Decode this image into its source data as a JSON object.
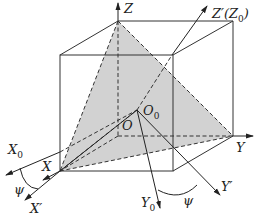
{
  "figure": {
    "colors": {
      "line": "#333333",
      "fill": "#d2d2d2"
    },
    "labels": {
      "z": "Z",
      "z_prime": "Z′(Z",
      "z_prime_sub": "0",
      "z_prime_close": ")",
      "x0": "X",
      "x0_sub": "0",
      "x": "X",
      "x_prime": "X′",
      "psi_left": "ψ",
      "o": "O",
      "o0": "O",
      "o0_sub": "0",
      "y": "Y",
      "y_prime": "Y′",
      "y0": "Y",
      "y0_sub": "0",
      "psi_right": "ψ"
    }
  }
}
